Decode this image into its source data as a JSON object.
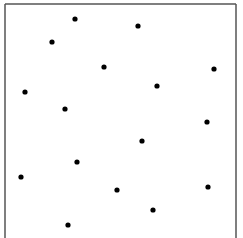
{
  "diagram": {
    "type": "point-set",
    "frame": {
      "sides": [
        "top",
        "left",
        "right"
      ],
      "stroke_color": "#555555"
    },
    "point_color": "#000000",
    "coordinate_space": {
      "x_range": [
        0,
        231
      ],
      "y_range": [
        0,
        234
      ],
      "origin": "top-left"
    },
    "points": [
      {
        "x": 70,
        "y": 15
      },
      {
        "x": 133,
        "y": 22
      },
      {
        "x": 47,
        "y": 38
      },
      {
        "x": 99,
        "y": 63
      },
      {
        "x": 209,
        "y": 65
      },
      {
        "x": 152,
        "y": 82
      },
      {
        "x": 20,
        "y": 88
      },
      {
        "x": 60,
        "y": 105
      },
      {
        "x": 202,
        "y": 118
      },
      {
        "x": 137,
        "y": 137
      },
      {
        "x": 72,
        "y": 158
      },
      {
        "x": 16,
        "y": 173
      },
      {
        "x": 112,
        "y": 186
      },
      {
        "x": 203,
        "y": 183
      },
      {
        "x": 148,
        "y": 206
      },
      {
        "x": 63,
        "y": 221
      }
    ]
  }
}
